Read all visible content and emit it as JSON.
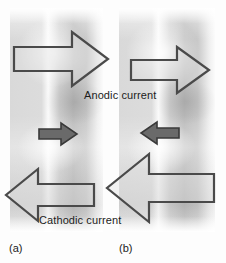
{
  "figure": {
    "panels": [
      {
        "id": "a",
        "caption": "(a)",
        "net_current_direction": "right",
        "arrows": [
          {
            "name": "anodic-current-arrow",
            "direction": "right",
            "relative_size": "large"
          },
          {
            "name": "net-current-arrow",
            "direction": "right",
            "relative_size": "small"
          },
          {
            "name": "cathodic-current-arrow",
            "direction": "left",
            "relative_size": "large"
          }
        ]
      },
      {
        "id": "b",
        "caption": "(b)",
        "net_current_direction": "left",
        "arrows": [
          {
            "name": "anodic-current-arrow",
            "direction": "right",
            "relative_size": "medium"
          },
          {
            "name": "net-current-arrow",
            "direction": "left",
            "relative_size": "small"
          },
          {
            "name": "cathodic-current-arrow",
            "direction": "left",
            "relative_size": "extra-large"
          }
        ]
      }
    ],
    "labels": {
      "anodic": "Anodic current",
      "cathodic": "Cathodic current"
    },
    "colors": {
      "outline_arrow_stroke": "#4a4a4a",
      "outline_arrow_fill": "#dedede",
      "solid_arrow_fill": "#6a6a6a",
      "text": "#1c1c1c",
      "band_light": "#fafafa",
      "band_dark": "#bdbdbd",
      "background": "#fdfdfd"
    }
  }
}
